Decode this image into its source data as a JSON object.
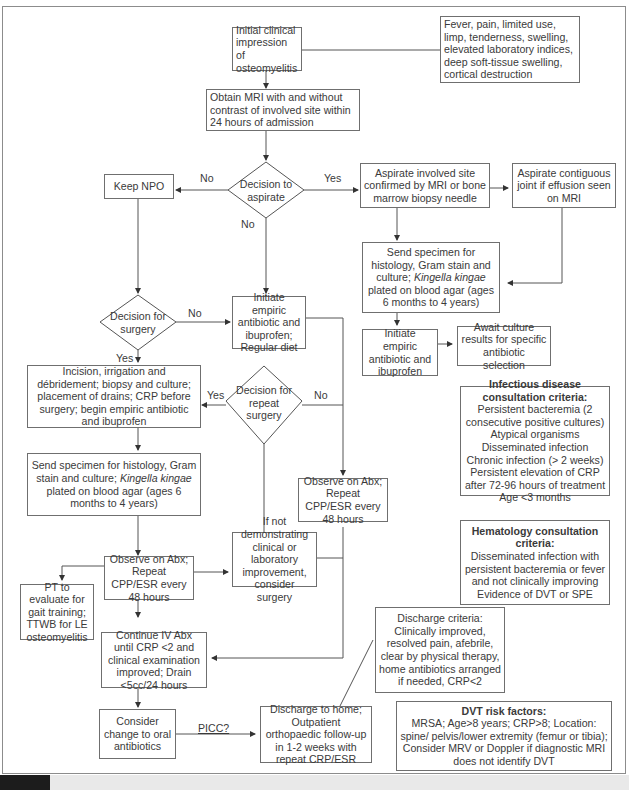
{
  "nodes": {
    "initial": "Initial clinical impression of osteomyelitis",
    "symptoms": "Fever, pain, limited use, limp, tenderness, swelling, elevated laboratory indices, deep soft-tissue swelling, cortical destruction",
    "mri": "Obtain MRI with and without contrast of involved site within 24 hours of admission",
    "decision_aspirate": "Decision to aspirate",
    "keep_npo": "Keep NPO",
    "aspirate_site": "Aspirate involved site confirmed by MRI or bone marrow biopsy needle",
    "aspirate_joint": "Aspirate contiguous joint if effusion seen on MRI",
    "send_specimen_right": {
      "pre": "Send specimen for histology, Gram stain and culture; ",
      "italic": "Kingella kingae",
      "post": " plated on blood agar (ages 6 months to 4 years)"
    },
    "initiate_right": "Initiate empiric antibiotic and ibuprofen",
    "await_culture": "Await culture results for specific antibiotic selection",
    "decision_surgery": "Decision for surgery",
    "initiate_center": "Initiate empiric antibiotic and ibuprofen; Regular diet",
    "incision": "Incision, irrigation and débridement; biopsy and culture; placement of drains; CRP before surgery; begin empiric antibiotic and ibuprofen",
    "decision_repeat": "Decision for repeat surgery",
    "observe_right": "Observe on Abx; Repeat CPP/ESR every 48 hours",
    "send_specimen_left": {
      "pre": "Send specimen for histology, Gram stain and culture; ",
      "italic": "Kingella kingae",
      "post": " plated on blood agar (ages 6 months to 4 years)"
    },
    "not_demonstrating": "If not demonstrating clinical or laboratory improvement, consider surgery",
    "observe_left": "Observe on Abx; Repeat CPP/ESR every 48 hours",
    "pt_evaluate": "PT to evaluate for gait training; TTWB for LE osteomyelitis",
    "continue_iv": "Continue IV Abx until CRP <2 and clinical examination improved; Drain <5cc/24 hours",
    "consider_oral": "Consider change to oral antibiotics",
    "discharge_home": "Discharge to home; Outpatient orthopaedic follow-up in 1-2 weeks with repeat CRP/ESR",
    "discharge_criteria": "Discharge criteria: Clinically improved, resolved pain, afebrile, clear by physical therapy, home antibiotics arranged if needed, CRP<2"
  },
  "infectious": {
    "title": "Infectious disease consultation criteria:",
    "items": [
      "Persistent bacteremia (2 consecutive positive cultures)",
      "Atypical organisms",
      "Disseminated infection",
      "Chronic infection (> 2 weeks)",
      "Persistent elevation of CRP after 72-96 hours of treatment",
      "Age <3 months"
    ]
  },
  "hematology": {
    "title": "Hematology consultation criteria:",
    "items": [
      "Disseminated infection with persistent bacteremia or fever and not clinically improving",
      "Evidence of DVT or SPE"
    ]
  },
  "dvt": {
    "title": "DVT risk factors:",
    "body": "MRSA; Age>8 years; CRP>8; Location: spine/ pelvis/lower extremity (femur or tibia); Consider MRV or Doppler if diagnostic MRI does not identify DVT"
  },
  "edge_labels": {
    "no_npo": "No",
    "yes_aspirate": "Yes",
    "no_aspirate_down": "No",
    "no_surgery": "No",
    "yes_surgery": "Yes",
    "yes_repeat": "Yes",
    "no_repeat": "No",
    "picc": "PICC?"
  }
}
